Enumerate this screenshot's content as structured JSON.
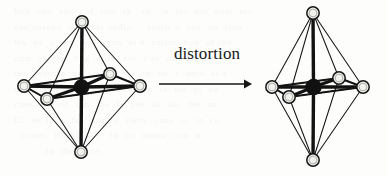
{
  "figure": {
    "caption_text": "distortion",
    "arrow_icon": "right-arrow-icon",
    "background_ghost_text": "  bon  con  anc  col  iom  th   ce   in  ter  not  nam  ers\n  can cureco  arbrelds audio     lastic n  ion  on  tion\n  tro  ne  c   en  and  rgen  at a  cuttin  bon  of the\n  com  el   ter  t  g  a  lo  ver  s as  on  tha  on\n  the  orienta  ns  fo  red  we  in  tic  i  onto  at a\n  car  bon o  a  to  wire  on s  on  in  ma  yl  on\n  cons  ne  rat  inn  the  le  pre  ds  for  the  on\n  Cl  in  is  a  ful  progra  there  cons  is  in  co\n    comer  insight  br   to  on  mono  tion  n\n            in  the  abov",
    "colors": {
      "ink": "#161616",
      "paper": "#fdfdfc",
      "vertex_fill": "#f2f2ee",
      "center_fill": "#111111"
    },
    "structures": [
      {
        "name": "octahedron-regular",
        "label": "regular octahedron",
        "center": {
          "x": 81.5,
          "y": 87
        },
        "vertices": {
          "top": {
            "x": 82,
            "y": 22,
            "r": 6.2
          },
          "bottom": {
            "x": 81,
            "y": 152,
            "r": 6.2
          },
          "left": {
            "x": 24,
            "y": 86,
            "r": 6.2
          },
          "right": {
            "x": 140,
            "y": 86,
            "r": 6.2
          },
          "front_near": {
            "x": 47,
            "y": 99,
            "r": 6.2
          },
          "back_far": {
            "x": 110,
            "y": 74,
            "r": 6.2
          }
        }
      },
      {
        "name": "octahedron-distorted",
        "label": "tetragonally distorted octahedron",
        "center": {
          "x": 313.5,
          "y": 87
        },
        "vertices": {
          "top": {
            "x": 313,
            "y": 13,
            "r": 6.2
          },
          "bottom": {
            "x": 313,
            "y": 160,
            "r": 6.2
          },
          "left": {
            "x": 272,
            "y": 87,
            "r": 6.2
          },
          "right": {
            "x": 363,
            "y": 87,
            "r": 6.2
          },
          "front_near": {
            "x": 289,
            "y": 97,
            "r": 6.2
          },
          "back_far": {
            "x": 339,
            "y": 78,
            "r": 6.2
          }
        }
      }
    ],
    "arrow": {
      "name": "distortion-arrow",
      "x1": 159,
      "y1": 84,
      "x2": 251,
      "y2": 84
    }
  }
}
